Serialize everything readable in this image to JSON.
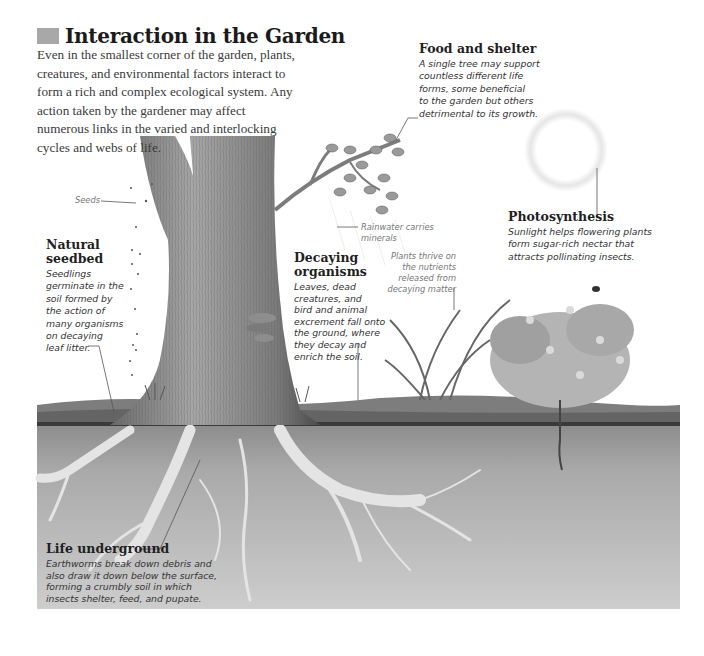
{
  "header": {
    "title": "Interaction in the Garden",
    "intro": "Even in the smallest corner of the garden, plants, creatures, and environmental factors interact to form a rich and complex ecological system. Any action taken by the gardener may affect numerous links in the varied and interlocking cycles and webs of life."
  },
  "callouts": {
    "food_shelter": {
      "heading": "Food and shelter",
      "lines": [
        "A single tree may support",
        "countless different life",
        "forms, some beneficial",
        "to the garden but others",
        "detrimental to its growth."
      ]
    },
    "seeds": {
      "label": "Seeds"
    },
    "natural_seedbed": {
      "heading_lines": [
        "Natural",
        "seedbed"
      ],
      "lines": [
        "Seedlings",
        "germinate in the",
        "soil formed by",
        "the action of",
        "many organisms",
        "on decaying",
        "leaf litter."
      ]
    },
    "rainwater": {
      "lines": [
        "Rainwater carries",
        "minerals"
      ]
    },
    "decaying_organisms": {
      "heading_lines": [
        "Decaying",
        "organisms"
      ],
      "lines": [
        "Leaves, dead",
        "creatures, and",
        "bird and animal",
        "excrement fall onto",
        "the ground, where",
        "they decay and",
        "enrich the soil."
      ]
    },
    "plants_thrive": {
      "lines": [
        "Plants thrive on",
        "the nutrients",
        "released from",
        "decaying matter"
      ]
    },
    "photosynthesis": {
      "heading": "Photosynthesis",
      "lines": [
        "Sunlight helps flowering plants",
        "form sugar-rich nectar that",
        "attracts pollinating insects."
      ]
    },
    "life_underground": {
      "heading": "Life underground",
      "lines": [
        "Earthworms break down debris and",
        "also draw it down below the surface,",
        "forming a crumbly soil in which",
        "insects shelter, feed, and pupate."
      ]
    }
  },
  "colors": {
    "title_swatch": "#a8a8a8",
    "soil_light": "#c9c9c9",
    "soil_dark": "#6e6e6e",
    "bark": "#8a8a8a",
    "leader_line": "#555555"
  }
}
